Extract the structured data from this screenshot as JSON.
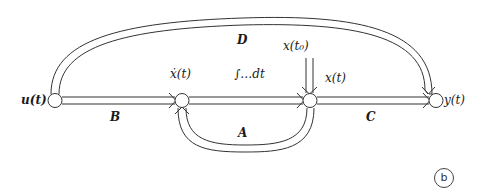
{
  "diagram": {
    "type": "state-space signal flow graph",
    "nodes": [
      {
        "id": "u",
        "label": "u(t)"
      },
      {
        "id": "xdot",
        "label": "ẋ(t)"
      },
      {
        "id": "x",
        "label": "x(t)"
      },
      {
        "id": "y",
        "label": "y(t)"
      }
    ],
    "edges": [
      {
        "from": "u",
        "to": "xdot",
        "label": "B"
      },
      {
        "from": "xdot",
        "to": "x",
        "label": "∫…dt"
      },
      {
        "from": "x",
        "to": "xdot",
        "label": "A"
      },
      {
        "from": "x",
        "to": "y",
        "label": "C"
      },
      {
        "from": "u",
        "to": "y",
        "label": "D"
      },
      {
        "from": "x(t0)",
        "to": "x",
        "label": "x(t₀)"
      }
    ],
    "labels": {
      "u": "u(t)",
      "xdot": "ẋ(t)",
      "integral": "∫…dt",
      "x0": "x(t₀)",
      "x": "x(t)",
      "y": "y(t)",
      "B": "B",
      "A": "A",
      "C": "C",
      "D": "D"
    },
    "panel_label": "b",
    "line_color": "#333333"
  }
}
